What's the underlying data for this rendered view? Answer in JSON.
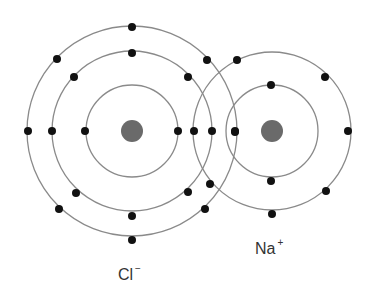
{
  "diagram": {
    "title": "",
    "atoms": [
      {
        "id": "cl",
        "label": "Cl",
        "charge": "−",
        "nucleus": {
          "cx": 132,
          "cy": 131,
          "r": 11
        },
        "shells": [
          46,
          80,
          105
        ],
        "electrons": [
          [
            85,
            131
          ],
          [
            178,
            131
          ],
          [
            132,
            53
          ],
          [
            74,
            77
          ],
          [
            188,
            77
          ],
          [
            52,
            131
          ],
          [
            212,
            131
          ],
          [
            76,
            193
          ],
          [
            188,
            192
          ],
          [
            132,
            216
          ],
          [
            132,
            27
          ],
          [
            57,
            59
          ],
          [
            207,
            60
          ],
          [
            28,
            131
          ],
          [
            235,
            131
          ],
          [
            59,
            209
          ],
          [
            205,
            209
          ],
          [
            132,
            240
          ]
        ]
      },
      {
        "id": "na",
        "label": "Na",
        "charge": "+",
        "nucleus": {
          "cx": 272,
          "cy": 131,
          "r": 11
        },
        "shells": [
          46,
          79
        ],
        "electrons": [
          [
            271,
            85
          ],
          [
            235,
            132
          ],
          [
            271,
            181
          ],
          [
            237,
            60
          ],
          [
            325,
            77
          ],
          [
            348,
            131
          ],
          [
            326,
            191
          ],
          [
            272,
            214
          ],
          [
            194,
            131
          ],
          [
            210,
            184
          ]
        ]
      }
    ],
    "colors": {
      "shell": "#8a8a8a",
      "electron": "#111111",
      "nucleus": "#6a6a6a"
    }
  }
}
